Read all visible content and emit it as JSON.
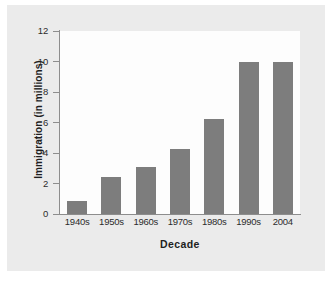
{
  "chart_data": {
    "type": "bar",
    "title": "",
    "xlabel": "Decade",
    "ylabel": "Immigration (in millions)",
    "categories": [
      "1940s",
      "1950s",
      "1960s",
      "1970s",
      "1980s",
      "1990s",
      "2004"
    ],
    "values": [
      0.85,
      2.45,
      3.1,
      4.25,
      6.25,
      9.95,
      9.95
    ],
    "ylim": [
      0,
      12
    ],
    "yticks": [
      0,
      2,
      4,
      6,
      8,
      10,
      12
    ],
    "ytick_labels": [
      "0",
      "2",
      "4",
      "6",
      "8",
      "10",
      "12"
    ],
    "grid": false,
    "legend": null,
    "bar_color": "#7d7d7d",
    "axis_color": "#8d8d8d",
    "plot_background": "#fdfdfd",
    "page_background": "#ebebeb"
  }
}
